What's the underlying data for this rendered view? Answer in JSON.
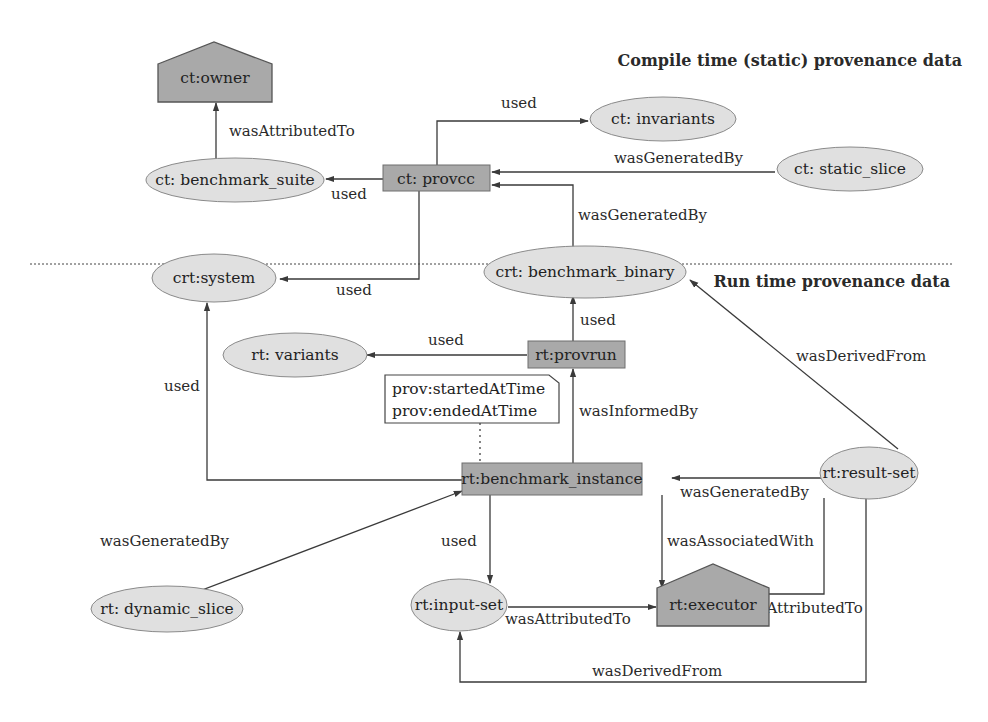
{
  "sections": {
    "compile_time": "Compile time (static) provenance data",
    "run_time": "Run time provenance data"
  },
  "nodes": {
    "ct_owner": {
      "label": "ct:owner",
      "type": "agent"
    },
    "ct_benchmark_suite": {
      "label": "ct: benchmark_suite",
      "type": "entity"
    },
    "ct_provcc": {
      "label": "ct: provcc",
      "type": "activity"
    },
    "ct_invariants": {
      "label": "ct: invariants",
      "type": "entity"
    },
    "ct_static_slice": {
      "label": "ct: static_slice",
      "type": "entity"
    },
    "crt_system": {
      "label": "crt:system",
      "type": "entity"
    },
    "crt_benchmark_binary": {
      "label": "crt: benchmark_binary",
      "type": "entity"
    },
    "rt_variants": {
      "label": "rt: variants",
      "type": "entity"
    },
    "rt_provrun": {
      "label": "rt:provrun",
      "type": "activity"
    },
    "rt_benchmark_instance": {
      "label": "rt:benchmark_instance",
      "type": "activity"
    },
    "rt_result_set": {
      "label": "rt:result-set",
      "type": "entity"
    },
    "rt_dynamic_slice": {
      "label": "rt: dynamic_slice",
      "type": "entity"
    },
    "rt_input_set": {
      "label": "rt:input-set",
      "type": "entity"
    },
    "rt_executor": {
      "label": "rt:executor",
      "type": "agent"
    }
  },
  "note": {
    "line1": "prov:startedAtTime",
    "line2": "prov:endedAtTime"
  },
  "edges": {
    "suite_owner": "wasAttributedTo",
    "provcc_suite": "used",
    "provcc_invariants": "used",
    "static_slice_provcc": "wasGeneratedBy",
    "binary_provcc": "wasGeneratedBy",
    "provcc_system": "used",
    "provrun_binary": "used",
    "provrun_variants": "used",
    "instance_provrun": "wasInformedBy",
    "instance_system": "used",
    "result_binary": "wasDerivedFrom",
    "result_instance": "wasGeneratedBy",
    "dynamic_slice_instance": "wasGeneratedBy",
    "instance_input": "used",
    "instance_executor": "wasAssociatedWith",
    "input_executor": "wasAttributedTo",
    "result_executor": "wasAttributedTo",
    "result_input": "wasDerivedFrom"
  }
}
